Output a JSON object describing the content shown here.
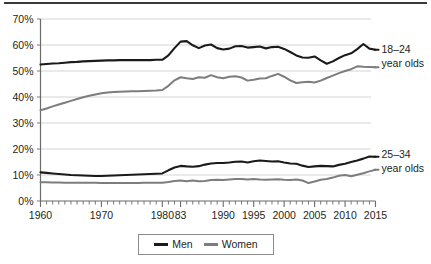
{
  "chart_data": {
    "type": "line",
    "title": "",
    "subtitle": "",
    "xlabel": "",
    "ylabel": "",
    "xlim": [
      1960,
      2015
    ],
    "ylim": [
      0,
      70
    ],
    "grid": true,
    "legend_position": "bottom",
    "y_ticks": [
      "0%",
      "10%",
      "20%",
      "30%",
      "40%",
      "50%",
      "60%",
      "70%"
    ],
    "y_tick_values": [
      0,
      10,
      20,
      30,
      40,
      50,
      60,
      70
    ],
    "x_ticks": [
      "1960",
      "1970",
      "1980",
      "83",
      "1990",
      "1995",
      "2000",
      "2005",
      "2010",
      "2015"
    ],
    "x_tick_values": [
      1960,
      1970,
      1980,
      1983,
      1990,
      1995,
      2000,
      2005,
      2010,
      2015
    ],
    "legend": [
      {
        "name": "Men",
        "color": "#1a1a1a"
      },
      {
        "name": "Women",
        "color": "#7d7d7d"
      }
    ],
    "annotations": [
      {
        "id": "group-18-24",
        "line1": "18–24",
        "line2": "year olds"
      },
      {
        "id": "group-25-34",
        "line1": "25–34",
        "line2": "year olds"
      }
    ],
    "series": [
      {
        "name": "Men 18–24",
        "group": "18–24 year olds",
        "color": "#1a1a1a",
        "x": [
          1960,
          1961,
          1962,
          1963,
          1964,
          1965,
          1966,
          1967,
          1968,
          1969,
          1970,
          1971,
          1972,
          1973,
          1974,
          1975,
          1976,
          1977,
          1978,
          1979,
          1980,
          1981,
          1982,
          1983,
          1984,
          1985,
          1986,
          1987,
          1988,
          1989,
          1990,
          1991,
          1992,
          1993,
          1994,
          1995,
          1996,
          1997,
          1998,
          1999,
          2000,
          2001,
          2002,
          2003,
          2004,
          2005,
          2006,
          2007,
          2008,
          2009,
          2010,
          2011,
          2012,
          2013,
          2014,
          2015
        ],
        "values": [
          52.5,
          52.7,
          52.9,
          53.0,
          53.2,
          53.4,
          53.5,
          53.7,
          53.8,
          53.9,
          54.0,
          54.1,
          54.1,
          54.2,
          54.2,
          54.2,
          54.2,
          54.2,
          54.2,
          54.3,
          54.3,
          56.0,
          58.8,
          61.3,
          61.5,
          59.9,
          58.8,
          59.8,
          60.2,
          58.8,
          58.3,
          58.6,
          59.5,
          59.6,
          59.0,
          59.2,
          59.4,
          58.7,
          59.2,
          59.3,
          58.5,
          57.3,
          56.0,
          55.2,
          55.1,
          55.6,
          54.1,
          52.8,
          53.7,
          55.0,
          56.1,
          56.8,
          58.4,
          60.4,
          58.6,
          58.2
        ]
      },
      {
        "name": "Women 18–24",
        "group": "18–24 year olds",
        "color": "#7d7d7d",
        "x": [
          1960,
          1961,
          1962,
          1963,
          1964,
          1965,
          1966,
          1967,
          1968,
          1969,
          1970,
          1971,
          1972,
          1973,
          1974,
          1975,
          1976,
          1977,
          1978,
          1979,
          1980,
          1981,
          1982,
          1983,
          1984,
          1985,
          1986,
          1987,
          1988,
          1989,
          1990,
          1991,
          1992,
          1993,
          1994,
          1995,
          1996,
          1997,
          1998,
          1999,
          2000,
          2001,
          2002,
          2003,
          2004,
          2005,
          2006,
          2007,
          2008,
          2009,
          2010,
          2011,
          2012,
          2013,
          2014,
          2015
        ],
        "values": [
          34.9,
          35.6,
          36.4,
          37.1,
          37.8,
          38.5,
          39.2,
          39.9,
          40.5,
          41.0,
          41.4,
          41.7,
          41.9,
          42.0,
          42.1,
          42.2,
          42.2,
          42.3,
          42.4,
          42.5,
          42.7,
          44.3,
          46.4,
          47.6,
          47.2,
          46.9,
          47.6,
          47.4,
          48.4,
          47.6,
          47.2,
          47.8,
          48.0,
          47.5,
          46.3,
          46.6,
          47.1,
          47.2,
          48.1,
          48.9,
          47.8,
          46.4,
          45.4,
          45.7,
          45.9,
          45.6,
          46.3,
          47.3,
          48.2,
          49.2,
          50.0,
          50.7,
          51.8,
          51.6,
          51.5,
          51.4
        ]
      },
      {
        "name": "Men 25–34",
        "group": "25–34 year olds",
        "color": "#1a1a1a",
        "x": [
          1960,
          1961,
          1962,
          1963,
          1964,
          1965,
          1966,
          1967,
          1968,
          1969,
          1970,
          1971,
          1972,
          1973,
          1974,
          1975,
          1976,
          1977,
          1978,
          1979,
          1980,
          1981,
          1982,
          1983,
          1984,
          1985,
          1986,
          1987,
          1988,
          1989,
          1990,
          1991,
          1992,
          1993,
          1994,
          1995,
          1996,
          1997,
          1998,
          1999,
          2000,
          2001,
          2002,
          2003,
          2004,
          2005,
          2006,
          2007,
          2008,
          2009,
          2010,
          2011,
          2012,
          2013,
          2014,
          2015
        ],
        "values": [
          11.0,
          10.8,
          10.6,
          10.4,
          10.2,
          10.0,
          9.9,
          9.8,
          9.7,
          9.6,
          9.6,
          9.7,
          9.8,
          9.9,
          10.0,
          10.1,
          10.2,
          10.3,
          10.4,
          10.5,
          10.6,
          11.8,
          12.9,
          13.5,
          13.3,
          13.2,
          13.4,
          14.0,
          14.4,
          14.6,
          14.6,
          14.8,
          15.1,
          15.2,
          14.8,
          15.3,
          15.6,
          15.4,
          15.2,
          15.3,
          14.8,
          14.4,
          14.3,
          13.6,
          13.1,
          13.3,
          13.5,
          13.4,
          13.3,
          13.9,
          14.3,
          15.0,
          15.6,
          16.3,
          17.1,
          17.0
        ]
      },
      {
        "name": "Women 25–34",
        "group": "25–34 year olds",
        "color": "#7d7d7d",
        "x": [
          1960,
          1961,
          1962,
          1963,
          1964,
          1965,
          1966,
          1967,
          1968,
          1969,
          1970,
          1971,
          1972,
          1973,
          1974,
          1975,
          1976,
          1977,
          1978,
          1979,
          1980,
          1981,
          1982,
          1983,
          1984,
          1985,
          1986,
          1987,
          1988,
          1989,
          1990,
          1991,
          1992,
          1993,
          1994,
          1995,
          1996,
          1997,
          1998,
          1999,
          2000,
          2001,
          2002,
          2003,
          2004,
          2005,
          2006,
          2007,
          2008,
          2009,
          2010,
          2011,
          2012,
          2013,
          2014,
          2015
        ],
        "values": [
          7.2,
          7.2,
          7.1,
          7.1,
          7.0,
          7.0,
          7.0,
          7.0,
          7.0,
          7.0,
          6.9,
          6.9,
          6.9,
          6.9,
          6.9,
          6.9,
          6.9,
          7.0,
          7.0,
          7.0,
          7.0,
          7.3,
          7.7,
          7.9,
          7.6,
          7.9,
          7.6,
          7.7,
          8.1,
          8.2,
          8.1,
          8.3,
          8.5,
          8.5,
          8.3,
          8.5,
          8.3,
          8.2,
          8.3,
          8.4,
          8.2,
          8.1,
          8.3,
          7.9,
          6.9,
          7.5,
          8.2,
          8.5,
          9.0,
          9.7,
          10.0,
          9.5,
          10.1,
          10.7,
          11.4,
          12.0
        ]
      }
    ]
  }
}
